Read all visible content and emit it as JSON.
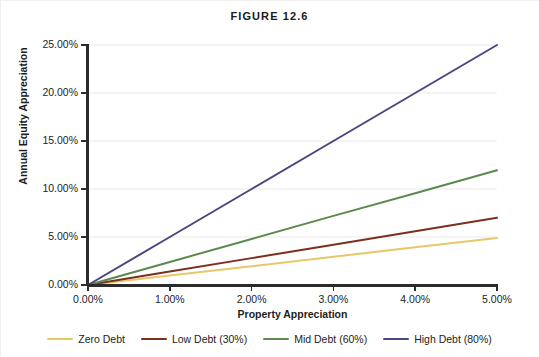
{
  "title": "FIGURE 12.6",
  "chart_data": {
    "type": "line",
    "title": "FIGURE 12.6",
    "xlabel": "Property Appreciation",
    "ylabel": "Annual Equity Appreciation",
    "x": [
      0,
      1,
      2,
      3,
      4,
      5
    ],
    "xlim": [
      0,
      5
    ],
    "ylim": [
      0,
      25
    ],
    "xtick_labels": [
      "0.00%",
      "1.00%",
      "2.00%",
      "3.00%",
      "4.00%",
      "5.00%"
    ],
    "ytick_labels": [
      "0.00%",
      "5.00%",
      "10.00%",
      "15.00%",
      "20.00%",
      "25.00%"
    ],
    "xticks": [
      0,
      1,
      2,
      3,
      4,
      5
    ],
    "yticks": [
      0,
      5,
      10,
      15,
      20,
      25
    ],
    "grid": "horizontal",
    "legend_position": "bottom",
    "series": [
      {
        "name": "Zero Debt",
        "color": "#e8c76a",
        "values": [
          0.0,
          0.98,
          1.96,
          2.94,
          3.92,
          4.9
        ]
      },
      {
        "name": "Low Debt (30%)",
        "color": "#7b2f1f",
        "values": [
          0.0,
          1.4,
          2.8,
          4.2,
          5.6,
          7.0
        ]
      },
      {
        "name": "Mid Debt (60%)",
        "color": "#5b8a4c",
        "values": [
          0.0,
          2.4,
          4.8,
          7.2,
          9.55,
          11.95
        ]
      },
      {
        "name": "High Debt (80%)",
        "color": "#4a4680",
        "values": [
          0.0,
          5.0,
          10.0,
          15.0,
          20.0,
          25.0
        ]
      }
    ]
  },
  "axes": {
    "y_title": "Annual Equity Appreciation",
    "x_title": "Property Appreciation",
    "y_ticks": [
      {
        "label": "0.00%",
        "value": 0
      },
      {
        "label": "5.00%",
        "value": 5
      },
      {
        "label": "10.00%",
        "value": 10
      },
      {
        "label": "15.00%",
        "value": 15
      },
      {
        "label": "20.00%",
        "value": 20
      },
      {
        "label": "25.00%",
        "value": 25
      }
    ],
    "x_ticks": [
      {
        "label": "0.00%",
        "value": 0
      },
      {
        "label": "1.00%",
        "value": 1
      },
      {
        "label": "2.00%",
        "value": 2
      },
      {
        "label": "3.00%",
        "value": 3
      },
      {
        "label": "4.00%",
        "value": 4
      },
      {
        "label": "5.00%",
        "value": 5
      }
    ]
  },
  "legend": {
    "items": [
      {
        "label": "Zero Debt",
        "color": "#e8c76a"
      },
      {
        "label": "Low Debt (30%)",
        "color": "#7b2f1f"
      },
      {
        "label": "Mid Debt (60%)",
        "color": "#5b8a4c"
      },
      {
        "label": "High Debt (80%)",
        "color": "#4a4680"
      }
    ]
  },
  "colors": {
    "axis": "#2b2b2b",
    "gridline": "#e9e9e9",
    "text": "#1d1d1d",
    "background": "#ffffff"
  }
}
